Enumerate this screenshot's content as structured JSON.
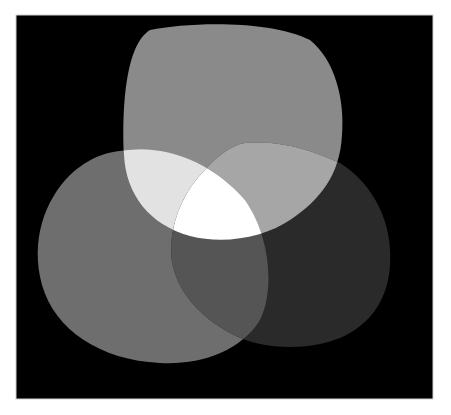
{
  "figure": {
    "background_color": "#000000",
    "page_color": "#ffffff",
    "frame": {
      "x": 16,
      "y": 15,
      "width": 417,
      "height": 384
    }
  },
  "blobs": [
    {
      "id": "top",
      "color": "#8a8a8a"
    },
    {
      "id": "left",
      "color": "#6e6e6e"
    },
    {
      "id": "right",
      "color": "#2a2a2a"
    }
  ],
  "overlaps": {
    "top_left": "#e2e2e2",
    "top_right": "#a6a6a6",
    "left_right": "#555555",
    "all_three": "#ffffff"
  }
}
